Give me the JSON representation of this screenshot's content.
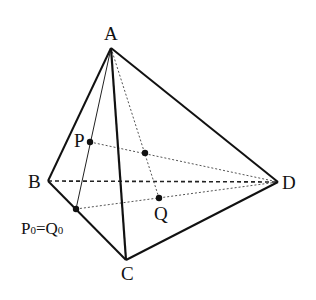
{
  "figure": {
    "type": "tetrahedron",
    "vertices": {
      "A": {
        "label": "A",
        "x": 111,
        "y": 48
      },
      "B": {
        "label": "B",
        "x": 48,
        "y": 181
      },
      "C": {
        "label": "C",
        "x": 126,
        "y": 260
      },
      "D": {
        "label": "D",
        "x": 278,
        "y": 182
      }
    },
    "points": {
      "P": {
        "label": "P",
        "x": 90,
        "y": 142
      },
      "Q": {
        "label": "Q",
        "x": 159,
        "y": 198
      },
      "M": {
        "label": "",
        "x": 145,
        "y": 153
      },
      "P0": {
        "label_main": "P",
        "label_sub": "0",
        "eq": "=",
        "label_main2": "Q",
        "label_sub2": "0",
        "x": 76,
        "y": 209
      }
    },
    "solid_edges": [
      "AB",
      "AC",
      "AD",
      "BC",
      "CD"
    ],
    "thin_edges": [
      "A-P0"
    ],
    "hidden_edges": [
      "BD"
    ],
    "dotted_segments": [
      "A-Q",
      "P-D",
      "P0-D"
    ],
    "colors": {
      "stroke": "#111111",
      "dotted": "#666666",
      "background": "#ffffff"
    }
  }
}
